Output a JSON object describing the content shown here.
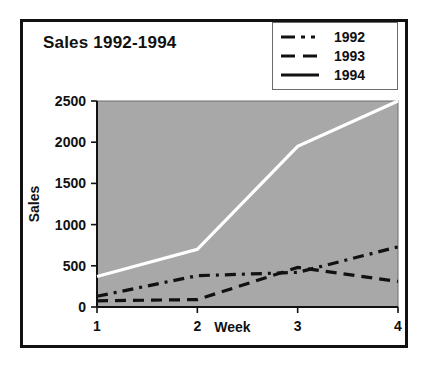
{
  "chart_data": {
    "type": "line",
    "title": "Sales 1992-1994",
    "xlabel": "Week",
    "ylabel": "Sales",
    "x": [
      1,
      2,
      3,
      4
    ],
    "xticklabels": [
      "1",
      "2",
      "3",
      "4"
    ],
    "yticklabels": [
      "0",
      "500",
      "1000",
      "1500",
      "2000",
      "2500"
    ],
    "yticks": [
      0,
      500,
      1000,
      1500,
      2000,
      2500
    ],
    "xlim": [
      1,
      4
    ],
    "ylim": [
      0,
      2500
    ],
    "grid": false,
    "legend_position": "top-right",
    "plot_background": "#a8a8a8",
    "page_background": "#ffffff",
    "series": [
      {
        "name": "1992",
        "values": [
          130,
          380,
          420,
          730
        ],
        "color": "#111111",
        "style": "dash-dot"
      },
      {
        "name": "1993",
        "values": [
          75,
          90,
          480,
          310
        ],
        "color": "#111111",
        "style": "dashed"
      },
      {
        "name": "1994",
        "values": [
          370,
          700,
          1950,
          2500
        ],
        "color": "#ffffff",
        "style": "solid"
      }
    ]
  },
  "legend": {
    "items": [
      {
        "label": "1992"
      },
      {
        "label": "1993"
      },
      {
        "label": "1994"
      }
    ]
  }
}
